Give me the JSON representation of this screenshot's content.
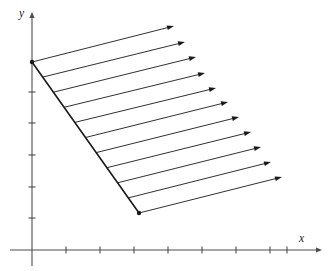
{
  "figure": {
    "title": "",
    "background_color": "#ffffff",
    "axis_color": "#4d4d4d",
    "ink_color": "#1a1a1a",
    "width": 334,
    "height": 271
  },
  "axes": {
    "x": {
      "label": "x",
      "origin_px": [
        32,
        250
      ],
      "arrow_tip_px": [
        322,
        250
      ],
      "tick_spacing_px": 34,
      "tick_positions_px": [
        66,
        100,
        134,
        168,
        202,
        236,
        270,
        287
      ],
      "tick_labels": []
    },
    "y": {
      "label": "y",
      "origin_px": [
        32,
        250
      ],
      "arrow_tip_px": [
        32,
        12
      ],
      "tick_spacing_px": 31.7,
      "tick_positions_px": [
        92,
        123,
        155,
        187,
        218
      ],
      "tick_labels": []
    }
  },
  "chart_data": {
    "type": "line",
    "title": "",
    "xlabel": "x",
    "ylabel": "y",
    "grid": false,
    "legend": null,
    "annotations": [],
    "boundary_segment": {
      "name": "slanted-boundary",
      "start_px": [
        32,
        62
      ],
      "end_px": [
        139,
        213
      ],
      "endpoint_dots": [
        [
          32,
          62
        ],
        [
          139,
          213
        ]
      ]
    },
    "arrow_count": 11,
    "arrows": [
      {
        "index": 1,
        "start_px": [
          32,
          62
        ],
        "tip_px": [
          174,
          26
        ]
      },
      {
        "index": 2,
        "start_px": [
          42.7,
          77.1
        ],
        "tip_px": [
          185,
          42
        ]
      },
      {
        "index": 3,
        "start_px": [
          53.4,
          92.2
        ],
        "tip_px": [
          196,
          57
        ]
      },
      {
        "index": 4,
        "start_px": [
          64.1,
          107.3
        ],
        "tip_px": [
          205,
          73
        ]
      },
      {
        "index": 5,
        "start_px": [
          74.8,
          122.4
        ],
        "tip_px": [
          216,
          88
        ]
      },
      {
        "index": 6,
        "start_px": [
          85.5,
          137.5
        ],
        "tip_px": [
          228,
          102
        ]
      },
      {
        "index": 7,
        "start_px": [
          96.2,
          152.6
        ],
        "tip_px": [
          239,
          117
        ]
      },
      {
        "index": 8,
        "start_px": [
          106.9,
          167.7
        ],
        "tip_px": [
          251,
          132
        ]
      },
      {
        "index": 9,
        "start_px": [
          117.6,
          182.8
        ],
        "tip_px": [
          261,
          147
        ]
      },
      {
        "index": 10,
        "start_px": [
          128.3,
          197.9
        ],
        "tip_px": [
          271,
          162
        ]
      },
      {
        "index": 11,
        "start_px": [
          139,
          213
        ],
        "tip_px": [
          282,
          177
        ]
      }
    ]
  }
}
